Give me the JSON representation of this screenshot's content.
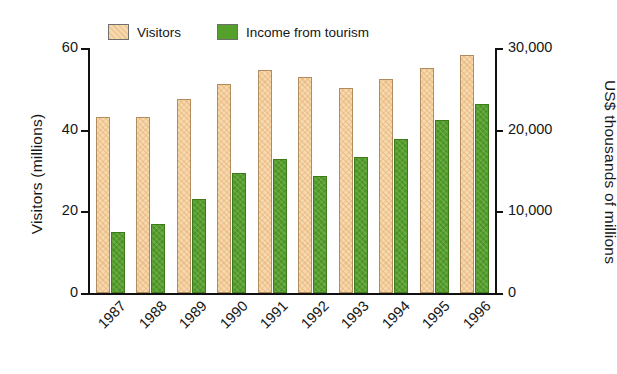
{
  "chart_data": {
    "type": "bar",
    "title": "",
    "categories": [
      "1987",
      "1988",
      "1989",
      "1990",
      "1991",
      "1992",
      "1993",
      "1994",
      "1995",
      "1996"
    ],
    "series": [
      {
        "name": "Visitors",
        "axis": "left",
        "unit": "millions",
        "color": "#f7d9ae",
        "values": [
          43.2,
          43.2,
          47.6,
          51.3,
          54.5,
          52.8,
          50.1,
          52.5,
          55.2,
          58.2
        ]
      },
      {
        "name": "Income from tourism",
        "axis": "right",
        "unit": "US$ thousands of millions",
        "color": "#55a02b",
        "values": [
          7500,
          8500,
          11500,
          14700,
          16400,
          14300,
          16600,
          18800,
          21200,
          23200
        ]
      }
    ],
    "xlabel": "",
    "ylabel": "Visitors (millions)",
    "ylabel_right": "US$ thousands of millions",
    "ylim": [
      0,
      60
    ],
    "ylim_right": [
      0,
      30000
    ],
    "yticks": [
      "0",
      "20",
      "40",
      "60"
    ],
    "ytick_values": [
      0,
      20,
      40,
      60
    ],
    "yticks_right": [
      "0",
      "10,000",
      "20,000",
      "30,000"
    ],
    "ytick_values_right": [
      0,
      10000,
      20000,
      30000
    ],
    "grid": false,
    "legend_position": "top"
  },
  "legend": {
    "items": [
      {
        "label": "Visitors",
        "color": "#f7d9ae"
      },
      {
        "label": "Income from tourism",
        "color": "#55a02b"
      }
    ]
  },
  "axes": {
    "left_title": "Visitors (millions)",
    "right_title": "US$ thousands of millions"
  }
}
